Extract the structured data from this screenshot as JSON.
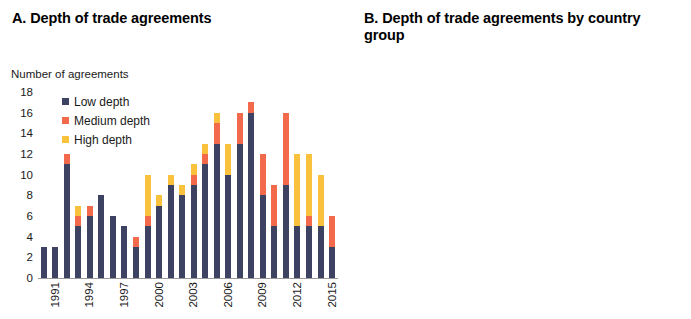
{
  "figure": {
    "panel_a": {
      "title": "A. Depth of trade agreements",
      "axis_caption": "Number of agreements",
      "legend": [
        {
          "label": "Low depth",
          "color": "#3d4263",
          "key": "low"
        },
        {
          "label": "Medium depth",
          "color": "#f2694b",
          "key": "medium"
        },
        {
          "label": "High depth",
          "color": "#f9c13c",
          "key": "high"
        }
      ]
    },
    "panel_b": {
      "title": "B. Depth of trade agreements by country group"
    }
  },
  "chart_data": [
    {
      "type": "bar",
      "id": "panel-a",
      "title": "A. Depth of trade agreements",
      "subtitle": "",
      "stacked": true,
      "xlabel": "",
      "ylabel": "Number of agreements",
      "ylim": [
        0,
        18
      ],
      "yticks": [
        18,
        16,
        14,
        12,
        10,
        8,
        6,
        4,
        2,
        0
      ],
      "grid": false,
      "legend": [
        "Low depth",
        "Medium depth",
        "High depth"
      ],
      "legend_position": "upper-left-inside",
      "categories": [
        "1991",
        "1992",
        "1993",
        "1994",
        "1995",
        "1996",
        "1997",
        "1998",
        "1999",
        "2000",
        "2001",
        "2002",
        "2003",
        "2004",
        "2005",
        "2006",
        "2007",
        "2008",
        "2009",
        "2010",
        "2011",
        "2012",
        "2013",
        "2014",
        "2015",
        "2016"
      ],
      "xtick_labels": [
        "1991",
        "1994",
        "1997",
        "2000",
        "2003",
        "2006",
        "2009",
        "2012",
        "2015"
      ],
      "xtick_indices": [
        0,
        3,
        6,
        9,
        12,
        15,
        18,
        21,
        24
      ],
      "series": [
        {
          "name": "Low depth",
          "color": "#3d4263",
          "values": [
            3,
            3,
            11,
            5,
            6,
            8,
            6,
            5,
            3,
            5,
            7,
            9,
            8,
            9,
            11,
            13,
            10,
            13,
            16,
            8,
            5,
            9,
            5,
            5,
            5,
            3
          ]
        },
        {
          "name": "Medium depth",
          "color": "#f2694b",
          "values": [
            0,
            0,
            1,
            1,
            1,
            0,
            0,
            0,
            1,
            1,
            0,
            0,
            0,
            1,
            1,
            2,
            0,
            3,
            1,
            4,
            4,
            7,
            0,
            1,
            0,
            3
          ]
        },
        {
          "name": "High depth",
          "color": "#f9c13c",
          "values": [
            0,
            0,
            0,
            1,
            0,
            0,
            0,
            0,
            0,
            4,
            1,
            1,
            1,
            1,
            1,
            1,
            3,
            0,
            0,
            0,
            0,
            0,
            7,
            6,
            5,
            0
          ]
        }
      ],
      "totals": [
        3,
        3,
        12,
        7,
        7,
        8,
        6,
        5,
        4,
        10,
        8,
        10,
        9,
        11,
        13,
        16,
        13,
        16,
        17,
        12,
        9,
        16,
        12,
        12,
        10,
        6
      ]
    },
    {
      "type": "bar",
      "id": "panel-b",
      "title": "B. Depth of trade agreements by country group",
      "xlabel": "",
      "ylabel": "",
      "ylim": [
        0,
        20
      ],
      "yticks": [
        20,
        16,
        12,
        8,
        4,
        0
      ],
      "grid": false,
      "color": "#3d4263",
      "categories": [
        "AE-AE",
        "AE-EMDE",
        "EMDE-EMDE"
      ],
      "values": [
        15.5,
        13.5,
        9.1
      ]
    }
  ]
}
